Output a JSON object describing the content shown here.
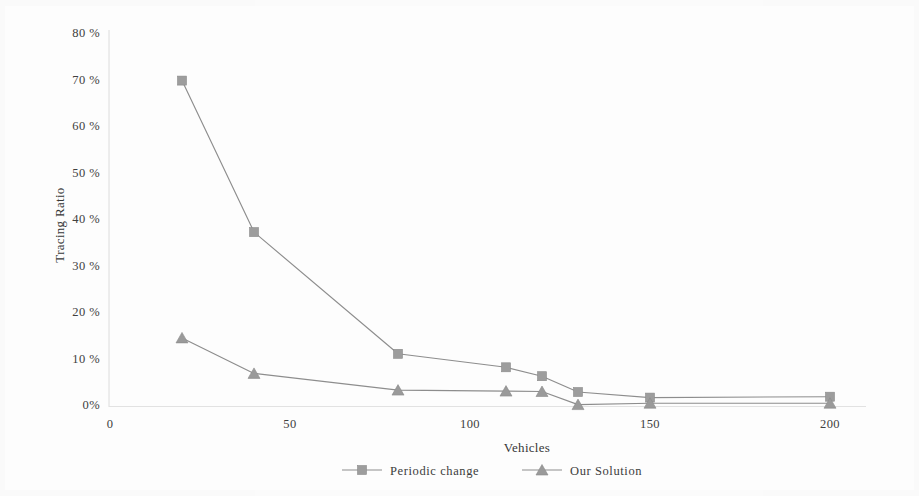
{
  "chart_data": {
    "type": "line",
    "title": "",
    "xlabel": "Vehicles",
    "ylabel": "Tracing Ratio",
    "xlim": [
      0,
      210
    ],
    "ylim": [
      0,
      80
    ],
    "xticks": [
      0,
      50,
      100,
      150,
      200
    ],
    "xtick_labels": [
      "0",
      "50",
      "100",
      "150",
      "200"
    ],
    "yticks": [
      0,
      10,
      20,
      30,
      40,
      50,
      60,
      70,
      80
    ],
    "ytick_labels": [
      "0%",
      "10 %",
      "20 %",
      "30 %",
      "40 %",
      "50 %",
      "60 %",
      "70 %",
      "80 %"
    ],
    "grid": false,
    "legend_position": "bottom",
    "series": [
      {
        "name": "Periodic change",
        "marker": "square",
        "color": "#8a8a8a",
        "x": [
          20,
          40,
          80,
          110,
          120,
          130,
          150,
          200
        ],
        "values": [
          69.8,
          37.3,
          11.2,
          8.3,
          6.4,
          3.0,
          1.8,
          2.0
        ]
      },
      {
        "name": "Our Solution",
        "marker": "triangle",
        "color": "#8a8a8a",
        "x": [
          20,
          40,
          80,
          110,
          120,
          130,
          150,
          200
        ],
        "values": [
          14.6,
          7.0,
          3.4,
          3.2,
          3.1,
          0.3,
          0.6,
          0.6
        ]
      }
    ]
  },
  "axes": {
    "y_title": "Tracing Ratio",
    "x_title": "Vehicles",
    "y_tick_0": "0%",
    "y_tick_10": "10 %",
    "y_tick_20": "20 %",
    "y_tick_30": "30 %",
    "y_tick_40": "40 %",
    "y_tick_50": "50 %",
    "y_tick_60": "60 %",
    "y_tick_70": "70 %",
    "y_tick_80": "80 %",
    "x_tick_0": "0",
    "x_tick_50": "50",
    "x_tick_100": "100",
    "x_tick_150": "150",
    "x_tick_200": "200"
  },
  "legend": {
    "item_1_label": "Periodic change",
    "item_2_label": "Our Solution"
  },
  "colors": {
    "line": "#8a8a8a",
    "marker": "#9a9a9a",
    "axis": "#d8d8d8",
    "text": "#3a3a3a",
    "background": "#fdfdfd"
  }
}
